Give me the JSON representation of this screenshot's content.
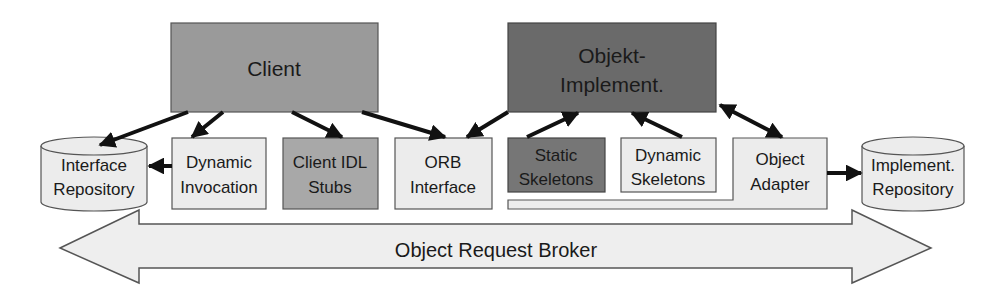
{
  "diagram": {
    "colors": {
      "client": "#9a9a9a",
      "implementation": "#6a6a6a",
      "light_box": "#ececec",
      "stubs": "#a8a8a8",
      "static_skeletons": "#767676",
      "broker": "#eeeeee",
      "stroke": "#555555",
      "arrow": "#111111"
    },
    "nodes": {
      "client": {
        "label": "Client"
      },
      "implementation": {
        "line1": "Objekt-",
        "line2": "Implement."
      },
      "interface_repository": {
        "line1": "Interface",
        "line2": "Repository"
      },
      "dynamic_invocation": {
        "line1": "Dynamic",
        "line2": "Invocation"
      },
      "client_idl_stubs": {
        "line1": "Client IDL",
        "line2": "Stubs"
      },
      "orb_interface": {
        "line1": "ORB",
        "line2": "Interface"
      },
      "static_skeletons": {
        "line1": "Static",
        "line2": "Skeletons"
      },
      "dynamic_skeletons": {
        "line1": "Dynamic",
        "line2": "Skeletons"
      },
      "object_adapter": {
        "line1": "Object",
        "line2": "Adapter"
      },
      "implementation_repository": {
        "line1": "Implement.",
        "line2": "Repository"
      }
    },
    "broker": {
      "label": "Object Request Broker"
    },
    "edges": [
      {
        "from": "client",
        "to": "interface_repository"
      },
      {
        "from": "client",
        "to": "dynamic_invocation"
      },
      {
        "from": "client",
        "to": "client_idl_stubs"
      },
      {
        "from": "client",
        "to": "orb_interface"
      },
      {
        "from": "implementation",
        "to": "orb_interface"
      },
      {
        "from": "static_skeletons",
        "to": "implementation"
      },
      {
        "from": "dynamic_skeletons",
        "to": "implementation"
      },
      {
        "from": "implementation",
        "to": "object_adapter",
        "bidirectional": true
      },
      {
        "from": "dynamic_invocation",
        "to": "interface_repository"
      },
      {
        "from": "object_adapter",
        "to": "implementation_repository"
      }
    ]
  }
}
